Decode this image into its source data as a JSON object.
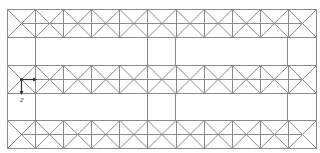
{
  "diagram": {
    "type": "truss-grid",
    "line_color": "#8a8a8a",
    "bg_color": "#ffffff",
    "frame": {
      "left": 7,
      "right": 316,
      "top": 9,
      "bottom": 148
    },
    "cell_width": 28.09,
    "cells_per_band": 11,
    "bands": [
      {
        "name": "top-band",
        "top": 9,
        "bottom": 37
      },
      {
        "name": "middle-band",
        "top": 65,
        "bottom": 93
      },
      {
        "name": "bottom-band",
        "top": 120,
        "bottom": 148
      }
    ],
    "gap_verticals_x": [
      7,
      35,
      147,
      175,
      287,
      316
    ],
    "axes": {
      "origin": {
        "x": 21,
        "y": 79
      },
      "x_axis": {
        "label": "x",
        "length": 14
      },
      "z_axis": {
        "label": "z",
        "length": 14
      },
      "color": "#333333"
    }
  }
}
